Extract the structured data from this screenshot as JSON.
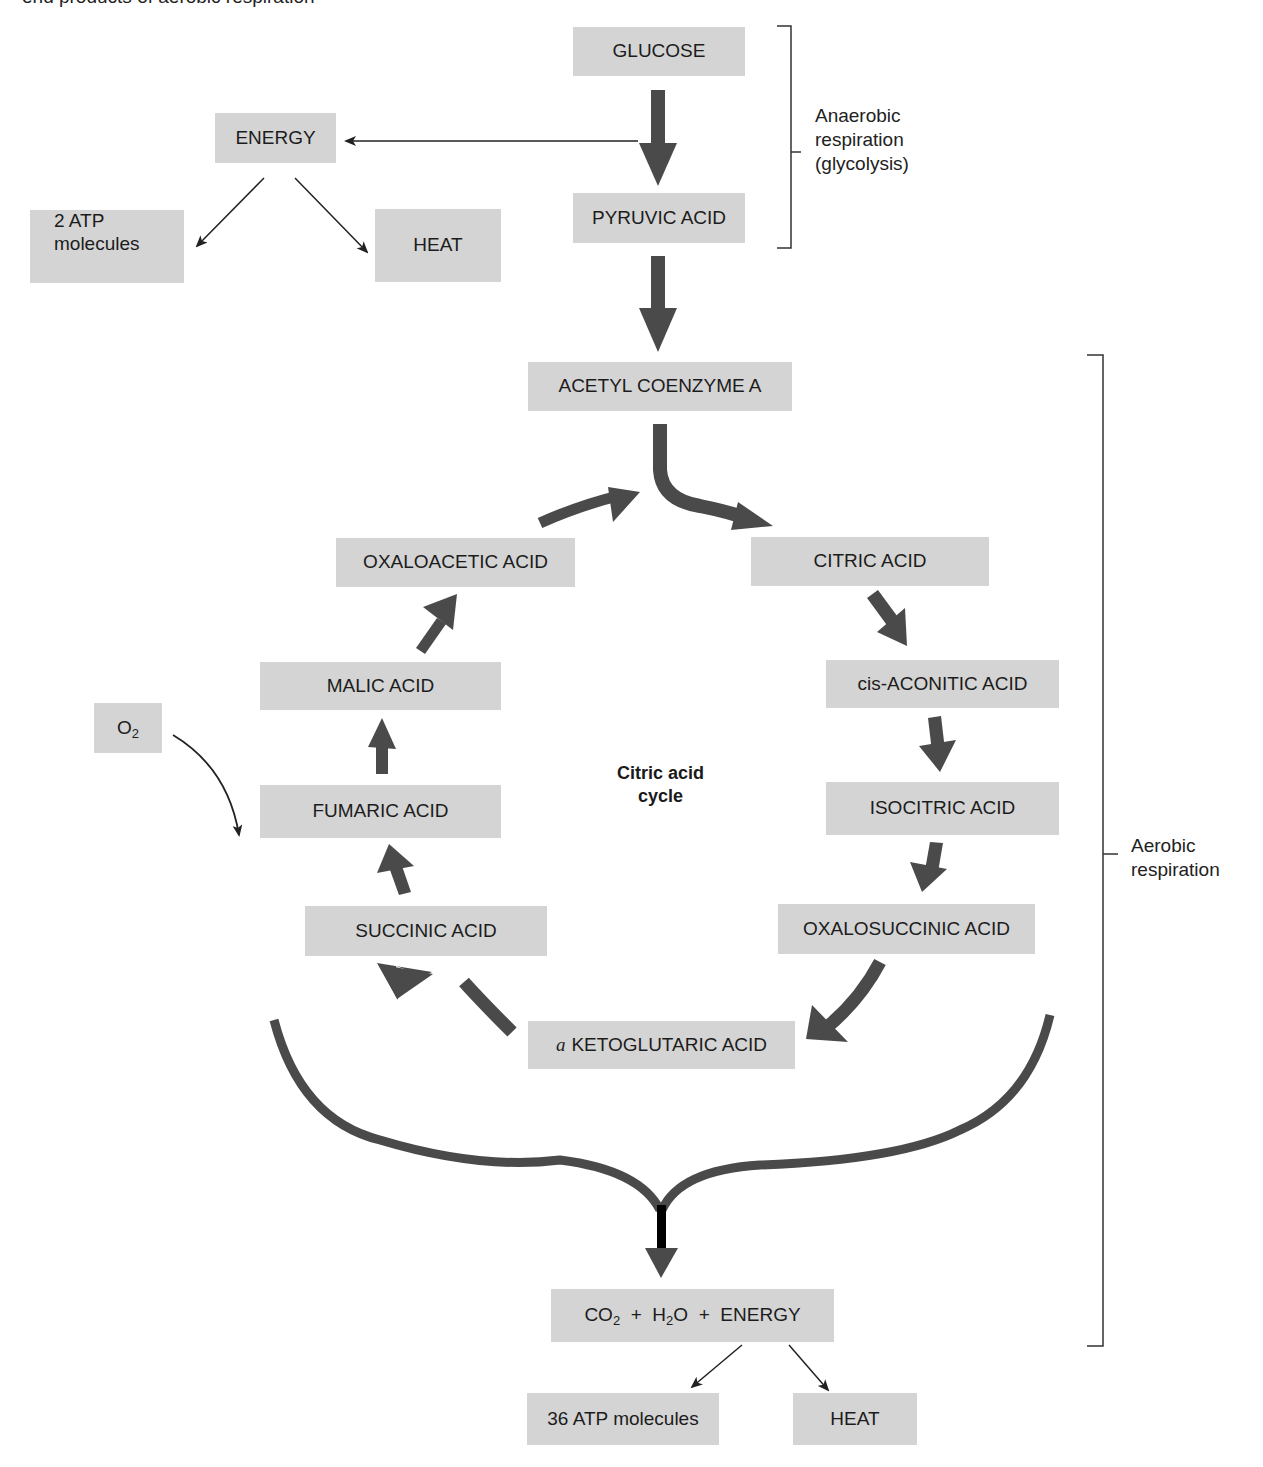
{
  "caption": "end products of aerobic respiration",
  "nodes": {
    "glucose": "GLUCOSE",
    "energy_top": "ENERGY",
    "atp2_line1": "2 ATP",
    "atp2_line2": "molecules",
    "heat_top": "HEAT",
    "pyruvic": "PYRUVIC ACID",
    "acetyl": "ACETYL COENZYME A",
    "oxaloacetic": "OXALOACETIC ACID",
    "citric": "CITRIC ACID",
    "malic": "MALIC ACID",
    "cis_aconitic": "cis-ACONITIC ACID",
    "o2": "O",
    "o2_sub": "2",
    "fumaric": "FUMARIC ACID",
    "isocitric": "ISOCITRIC ACID",
    "succinic": "SUCCINIC ACID",
    "oxalosuccinic": "OXALOSUCCINIC ACID",
    "ketoglutaric_prefix": "a",
    "ketoglutaric": "KETOGLUTARIC ACID",
    "final_co": "CO",
    "final_co_sub": "2",
    "final_plus1": "+",
    "final_h": "H",
    "final_h_sub": "2",
    "final_o": "O",
    "final_plus2": "+",
    "final_energy": "ENERGY",
    "atp36": "36 ATP molecules",
    "heat_bottom": "HEAT"
  },
  "labels": {
    "anaerobic_line1": "Anaerobic",
    "anaerobic_line2": "respiration",
    "anaerobic_line3": "(glycolysis)",
    "aerobic_line1": "Aerobic",
    "aerobic_line2": "respiration",
    "cycle_line1": "Citric acid",
    "cycle_line2": "cycle"
  },
  "colors": {
    "box_fill": "#d4d4d4",
    "arrow_fill": "#4a4a4a",
    "thin_line": "#222222"
  }
}
